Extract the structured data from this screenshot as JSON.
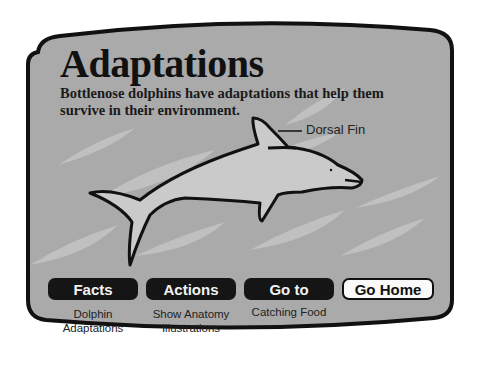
{
  "page": {
    "title": "Adaptations",
    "subtitle": "Bottlenose dolphins have adaptations that help them survive in their environment."
  },
  "illustration": {
    "subject": "dolphin-outline",
    "label": "Dorsal Fin"
  },
  "nav": {
    "buttons": [
      {
        "label": "Facts",
        "caption": [
          "Dolphin",
          "Adaptations"
        ],
        "style": "dark"
      },
      {
        "label": "Actions",
        "caption": [
          "Show Anatomy",
          "Illustrations"
        ],
        "style": "dark"
      },
      {
        "label": "Go to",
        "caption": [
          "Catching Food"
        ],
        "style": "dark"
      },
      {
        "label": "Go Home",
        "caption": [],
        "style": "light"
      }
    ]
  },
  "colors": {
    "panel_bg": "#a9a9a9",
    "panel_border": "#111111",
    "streak": "#c4c4c4",
    "dolphin_fill": "#c9c9c9",
    "button_dark": "#151515"
  }
}
